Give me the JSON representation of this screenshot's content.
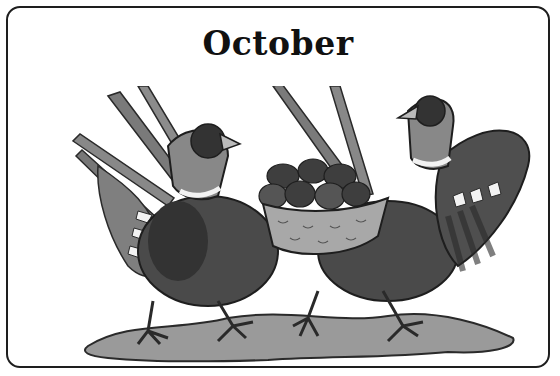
{
  "card": {
    "title": "October",
    "illustration": {
      "subject": "two pheasants carrying a basket of nuts",
      "style": "grayscale",
      "colors": {
        "border": "#1e1e1e",
        "ground": "#9a9a9a",
        "body_dark": "#3a3a3a",
        "body_mid": "#6a6a6a",
        "feather_light": "#8c8c8c",
        "basket": "#a8a8a8",
        "collar": "#f2f2f2"
      }
    }
  }
}
